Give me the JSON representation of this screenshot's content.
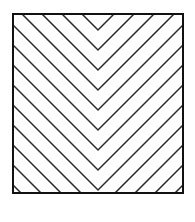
{
  "figure": {
    "name": "chevron-hatched-square",
    "canvas": {
      "width": 195,
      "height": 222,
      "background_color": "#FFFFFF"
    },
    "square": {
      "x": 13,
      "y": 14,
      "width": 170,
      "height": 179,
      "fill_color": "#FFFFFF",
      "stroke_color": "#111111",
      "stroke_width": 2
    },
    "hatching": {
      "pattern": "nested-chevron",
      "direction": "apex-down",
      "apex_x": 98,
      "angle_degrees": 45,
      "spacing_px": 10,
      "stroke_color": "#2A2A2A",
      "stroke_width": 1.5,
      "line_count": 17,
      "apex_count": 9,
      "apex_y_values": [
        30,
        50,
        70,
        90,
        110,
        130,
        150,
        170,
        190
      ]
    }
  }
}
